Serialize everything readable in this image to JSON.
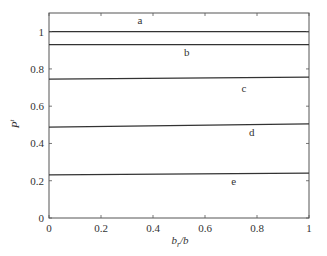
{
  "chart_data": {
    "type": "line",
    "title": "",
    "xlabel": "b_r/b",
    "xlabel_main": "b",
    "xlabel_sub": "r",
    "xlabel_tail": "/b",
    "ylabel": "P^t",
    "ylabel_main": "P",
    "ylabel_sup": "t",
    "xlim": [
      0,
      1
    ],
    "ylim": [
      0,
      1.1
    ],
    "xticks": [
      0,
      0.2,
      0.4,
      0.6,
      0.8,
      1
    ],
    "xtick_labels": [
      "0",
      "0.2",
      "0.4",
      "0.6",
      "0.8",
      "1"
    ],
    "yticks": [
      0,
      0.2,
      0.4,
      0.6,
      0.8,
      1
    ],
    "ytick_labels": [
      "0",
      "0.2",
      "0.4",
      "0.6",
      "0.8",
      "1"
    ],
    "grid": false,
    "box": true,
    "x": [
      0,
      1
    ],
    "series": [
      {
        "name": "a",
        "values": [
          1.0,
          1.0
        ],
        "label_pos": [
          0.35,
          1.06
        ]
      },
      {
        "name": "b",
        "values": [
          0.93,
          0.93
        ],
        "label_pos": [
          0.53,
          0.89
        ]
      },
      {
        "name": "c",
        "values": [
          0.745,
          0.756
        ],
        "label_pos": [
          0.75,
          0.7
        ]
      },
      {
        "name": "d",
        "values": [
          0.488,
          0.505
        ],
        "label_pos": [
          0.78,
          0.46
        ]
      },
      {
        "name": "e",
        "values": [
          0.231,
          0.241
        ],
        "label_pos": [
          0.71,
          0.2
        ]
      }
    ],
    "colors": {
      "line": "#333333",
      "axis": "#555555",
      "background": "#ffffff"
    }
  }
}
